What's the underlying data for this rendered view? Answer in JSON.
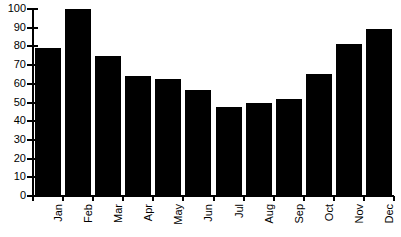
{
  "chart_data": {
    "type": "bar",
    "title": "",
    "subtitle": "",
    "xlabel": "",
    "ylabel": "",
    "categories": [
      "Jan",
      "Feb",
      "Mar",
      "Apr",
      "May",
      "Jun",
      "Jul",
      "Aug",
      "Sep",
      "Oct",
      "Nov",
      "Dec"
    ],
    "values": [
      79,
      100,
      75,
      64,
      62.5,
      56.5,
      47.5,
      49.5,
      52,
      65,
      81.5,
      89.5
    ],
    "ylim": [
      0,
      100
    ],
    "ytick_labels": [
      "0",
      "10",
      "20",
      "30",
      "40",
      "50",
      "60",
      "70",
      "80",
      "90",
      "100"
    ],
    "ytick_values": [
      0,
      10,
      20,
      30,
      40,
      50,
      60,
      70,
      80,
      90,
      100
    ],
    "grid": false,
    "legend": null,
    "legend_position": "none",
    "bar_color": "#000000",
    "axis_color": "#000000",
    "background_color": "#ffffff",
    "xtick_label_rotation": 90
  }
}
